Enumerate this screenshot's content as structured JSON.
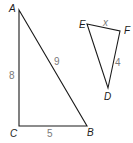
{
  "diagram": {
    "type": "similar-triangles",
    "triangle_abc": {
      "vertices": {
        "A": {
          "label": "A",
          "x": 19,
          "y": 10
        },
        "B": {
          "label": "B",
          "x": 87,
          "y": 126
        },
        "C": {
          "label": "C",
          "x": 19,
          "y": 126
        }
      },
      "sides": {
        "AC": {
          "label": "8"
        },
        "AB": {
          "label": "9"
        },
        "CB": {
          "label": "5"
        }
      }
    },
    "triangle_efd": {
      "vertices": {
        "E": {
          "label": "E",
          "x": 87,
          "y": 24
        },
        "F": {
          "label": "F",
          "x": 120,
          "y": 31
        },
        "D": {
          "label": "D",
          "x": 108,
          "y": 88
        }
      },
      "sides": {
        "EF": {
          "label": "x"
        },
        "FD": {
          "label": "4"
        }
      }
    },
    "colors": {
      "line": "#1a1a1a",
      "vertex_label": "#1a1a1a",
      "side_label": "#7a7a7a",
      "background": "#ffffff"
    }
  }
}
